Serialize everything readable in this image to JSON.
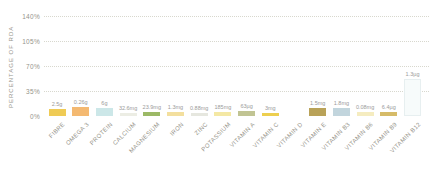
{
  "chart_data": {
    "type": "bar",
    "title": "",
    "ylabel": "PERCENTAGE OF RDA",
    "xlabel": "",
    "ylim": [
      0,
      140
    ],
    "grid": "horizontal-dotted",
    "legend": "none",
    "yticks": [
      {
        "value": 0,
        "label": "0%"
      },
      {
        "value": 35,
        "label": "35%"
      },
      {
        "value": 70,
        "label": "70%"
      },
      {
        "value": 105,
        "label": "105%"
      },
      {
        "value": 140,
        "label": "140%"
      }
    ],
    "bars": [
      {
        "category": "FIBRE",
        "value_label": "2.5g",
        "pct_rda": 10,
        "color": "#efcb55"
      },
      {
        "category": "OMEGA 3",
        "value_label": "0.26g",
        "pct_rda": 12.5,
        "color": "#f4b971"
      },
      {
        "category": "PROTEIN",
        "value_label": "6g",
        "pct_rda": 11,
        "color": "#cce7e8"
      },
      {
        "category": "CALCIUM",
        "value_label": "32.6mg",
        "pct_rda": 4,
        "color": "#ecede4"
      },
      {
        "category": "MAGNESIUM",
        "value_label": "23.9mg",
        "pct_rda": 6,
        "color": "#9cb966"
      },
      {
        "category": "IRON",
        "value_label": "1.3mg",
        "pct_rda": 6,
        "color": "#f3df9e"
      },
      {
        "category": "ZINC",
        "value_label": "0.88mg",
        "pct_rda": 4.5,
        "color": "#e6e7df"
      },
      {
        "category": "POTASSIUM",
        "value_label": "185mg",
        "pct_rda": 6,
        "color": "#f4e8a4"
      },
      {
        "category": "VITAMIN A",
        "value_label": "63µg",
        "pct_rda": 7,
        "color": "#c1c493"
      },
      {
        "category": "VITAMIN C",
        "value_label": "3mg",
        "pct_rda": 4,
        "color": "#edcf4f"
      },
      {
        "category": "VITAMIN D",
        "value_label": "",
        "pct_rda": 0,
        "color": "#ffffff"
      },
      {
        "category": "VITAMIN E",
        "value_label": "1.5mg",
        "pct_rda": 11,
        "color": "#b9a258"
      },
      {
        "category": "VITAMIN B3",
        "value_label": "1.8mg",
        "pct_rda": 11,
        "color": "#c2d5dd"
      },
      {
        "category": "VITAMIN B6",
        "value_label": "0.08mg",
        "pct_rda": 6,
        "color": "#f5ecc0"
      },
      {
        "category": "VITAMIN B9",
        "value_label": "6.4µg",
        "pct_rda": 5,
        "color": "#d6bb68"
      },
      {
        "category": "VITAMIN B12",
        "value_label": "1.3µg",
        "pct_rda": 52,
        "color": "#f7fbfb",
        "border_color": "#e7eff0"
      }
    ]
  },
  "colors": {
    "background": "#ffffff",
    "gridline": "#d8d8ce",
    "axis_text": "#96948a",
    "value_text": "#9b9b9b"
  }
}
